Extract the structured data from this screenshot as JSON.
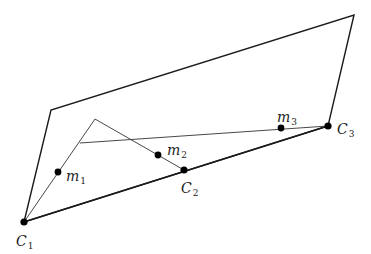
{
  "diagram": {
    "colors": {
      "stroke": "#1a1a1a",
      "thin": "#333333",
      "point": "#000000",
      "background": "#ffffff"
    },
    "plane": {
      "vertices": [
        [
          24,
          222
        ],
        [
          51,
          110
        ],
        [
          354,
          15
        ],
        [
          328,
          126
        ]
      ]
    },
    "camera_points": [
      {
        "id": "C1",
        "base": "C",
        "sub": "1",
        "x": 24,
        "y": 222,
        "label_x": 16,
        "label_y": 246
      },
      {
        "id": "C2",
        "base": "C",
        "sub": "2",
        "x": 184,
        "y": 170,
        "label_x": 181,
        "label_y": 193
      },
      {
        "id": "C3",
        "base": "C",
        "sub": "3",
        "x": 328,
        "y": 126,
        "label_x": 337,
        "label_y": 134
      }
    ],
    "image_points": [
      {
        "id": "m1",
        "base": "m",
        "sub": "1",
        "x": 58,
        "y": 172,
        "label_x": 66,
        "label_y": 181
      },
      {
        "id": "m2",
        "base": "m",
        "sub": "2",
        "x": 158,
        "y": 155,
        "label_x": 167,
        "label_y": 155
      },
      {
        "id": "m3",
        "base": "m",
        "sub": "3",
        "x": 281,
        "y": 128,
        "label_x": 277,
        "label_y": 122
      }
    ],
    "rays": [
      {
        "from": [
          24,
          222
        ],
        "to": [
          95,
          119
        ]
      },
      {
        "from": [
          95,
          119
        ],
        "to": [
          184,
          170
        ]
      },
      {
        "from": [
          80,
          143
        ],
        "to": [
          328,
          126
        ]
      }
    ]
  }
}
